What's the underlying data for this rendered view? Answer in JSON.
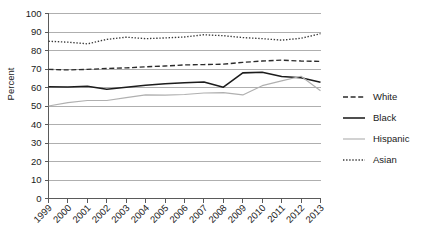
{
  "chart_data": {
    "type": "line",
    "title": "",
    "subtitle": "",
    "xlabel": "",
    "ylabel": "Percent",
    "x": [
      1999,
      2000,
      2001,
      2002,
      2003,
      2004,
      2005,
      2006,
      2007,
      2008,
      2009,
      2010,
      2011,
      2012,
      2013
    ],
    "categories": [
      "1999",
      "2000",
      "2001",
      "2002",
      "2003",
      "2004",
      "2005",
      "2006",
      "2007",
      "2008",
      "2009",
      "2010",
      "2011",
      "2012",
      "2013"
    ],
    "ylim": [
      0,
      100
    ],
    "yticks": [
      0,
      10,
      20,
      30,
      40,
      50,
      60,
      70,
      80,
      90,
      100
    ],
    "ytick_labels": [
      "0",
      "10",
      "20",
      "30",
      "40",
      "50",
      "60",
      "70",
      "80",
      "90",
      "100"
    ],
    "grid": true,
    "grid_axis": "y",
    "legend_position": "right",
    "series": [
      {
        "name": "White",
        "style": "dashed",
        "color": "#2b2b2b",
        "values": [
          69.8,
          69.5,
          69.8,
          70.3,
          70.6,
          71.2,
          71.6,
          72.2,
          72.4,
          72.6,
          73.6,
          74.3,
          74.8,
          74.3,
          74.1
        ]
      },
      {
        "name": "Black",
        "style": "solid",
        "color": "#1c1c1c",
        "values": [
          60.4,
          60.3,
          60.7,
          59.0,
          60.1,
          61.2,
          62.0,
          62.6,
          63.0,
          60.2,
          67.9,
          68.2,
          66.0,
          65.3,
          62.9
        ]
      },
      {
        "name": "Hispanic",
        "style": "solid",
        "color": "#b0b0b0",
        "values": [
          50.0,
          51.8,
          53.0,
          53.0,
          54.5,
          56.0,
          55.9,
          56.2,
          57.0,
          57.2,
          56.0,
          61.0,
          63.6,
          66.1,
          58.2
        ]
      },
      {
        "name": "Asian",
        "style": "dotted",
        "color": "#3a3a3a",
        "values": [
          85.0,
          84.5,
          83.6,
          86.0,
          87.2,
          86.4,
          86.8,
          87.3,
          88.5,
          88.0,
          87.0,
          86.4,
          85.6,
          86.6,
          89.1
        ]
      }
    ]
  },
  "legend": {
    "items": [
      {
        "label": "White"
      },
      {
        "label": "Black"
      },
      {
        "label": "Hispanic"
      },
      {
        "label": "Asian"
      }
    ]
  }
}
